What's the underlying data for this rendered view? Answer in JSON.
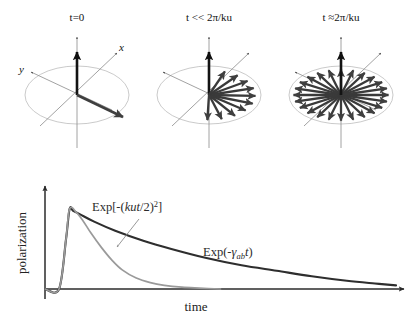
{
  "figure": {
    "background_color": "#ffffff"
  },
  "panels": [
    {
      "id": "panel-t0",
      "title": "t=0",
      "title_plain": "t=0",
      "axis_labels": {
        "x": "x",
        "y": "y"
      },
      "description": "single polarization vector aligned along x",
      "arrow_count": 1,
      "fan_span_degrees": 0,
      "arrow_angles_deg": [
        -22
      ]
    },
    {
      "id": "panel-t-small",
      "title": "t << 2π/ku",
      "title_plain": "t << 2pi/ku",
      "axis_labels": {
        "x": "",
        "y": ""
      },
      "description": "vectors begin to fan out over a partial angular spread",
      "arrow_count": 10,
      "fan_span_degrees": 130,
      "arrow_angles_deg": [
        -70,
        -52,
        -34,
        -16,
        2,
        20,
        38,
        56,
        74,
        92
      ]
    },
    {
      "id": "panel-t-large",
      "title": "t ≈2π/ku",
      "title_plain": "t ~ 2pi/ku",
      "axis_labels": {
        "x": "",
        "y": ""
      },
      "description": "vectors spread uniformly over the full circle, net polarization cancels",
      "arrow_count": 24,
      "fan_span_degrees": 360,
      "arrow_angles_deg": [
        0,
        15,
        30,
        45,
        60,
        75,
        90,
        105,
        120,
        135,
        150,
        165,
        180,
        195,
        210,
        225,
        240,
        255,
        270,
        285,
        300,
        315,
        330,
        345
      ]
    }
  ],
  "colors": {
    "vector_dark": "#3a3a3a",
    "vector_black": "#111111",
    "ellipse": "#b9b9b9",
    "axis_line": "#777777",
    "curve_exponential": "#2e2e2e",
    "curve_gaussian": "#9a9a9a",
    "pointer": "#8d8d8d",
    "plot_axis": "#2b2b2b"
  },
  "chart_data": {
    "type": "line",
    "title": "",
    "xlabel": "time",
    "ylabel": "polarization",
    "xlim": [
      0,
      1
    ],
    "ylim": [
      0,
      1
    ],
    "grid": false,
    "legend_position": "inline-annotations",
    "x_ticks": [],
    "y_ticks": [],
    "series": [
      {
        "name": "Exp(-γab t)",
        "label_text": "Exp(-γabt)",
        "label_parts": {
          "prefix": "Exp(-",
          "symbol": "γ",
          "subscript": "ab",
          "variable": "t",
          "suffix": ")"
        },
        "color": "#2e2e2e",
        "description": "slow single-exponential decay of the homogeneous polarization",
        "decay_constant": 2.6,
        "x": [
          0.0,
          0.04,
          0.06,
          0.07,
          0.08,
          0.1,
          0.14,
          0.2,
          0.28,
          0.36,
          0.46,
          0.56,
          0.66,
          0.76,
          0.86,
          0.94,
          1.0
        ],
        "y": [
          0.0,
          0.0,
          0.55,
          0.88,
          0.86,
          0.82,
          0.74,
          0.64,
          0.53,
          0.44,
          0.34,
          0.26,
          0.2,
          0.14,
          0.09,
          0.06,
          0.04
        ]
      },
      {
        "name": "Exp[-(kut/2)^2]",
        "label_text": "Exp[-(kut/2)²]",
        "label_parts": {
          "prefix": "Exp[-(",
          "variable": "kut",
          "divisor": "/2)",
          "exponent": "2",
          "suffix": "]"
        },
        "color": "#9a9a9a",
        "description": "fast Gaussian Doppler dephasing envelope",
        "x": [
          0.0,
          0.04,
          0.06,
          0.07,
          0.09,
          0.11,
          0.13,
          0.16,
          0.19,
          0.22,
          0.26,
          0.3,
          0.34,
          0.39,
          0.44,
          0.5
        ],
        "y": [
          0.0,
          0.0,
          0.55,
          0.88,
          0.84,
          0.74,
          0.62,
          0.46,
          0.32,
          0.21,
          0.12,
          0.07,
          0.04,
          0.02,
          0.01,
          0.0
        ]
      }
    ],
    "annotations": [
      {
        "text": "Exp[-(kut/2)²]",
        "target": "gaussian-curve",
        "has_pointer": true
      },
      {
        "text": "Exp(-γabt)",
        "target": "exponential-curve",
        "has_pointer": false
      }
    ]
  }
}
